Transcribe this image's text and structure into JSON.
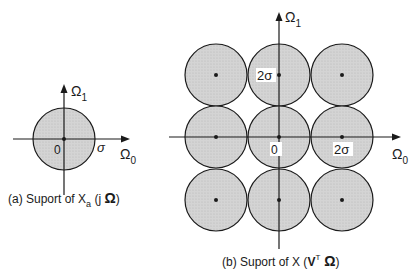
{
  "figure_a": {
    "caption_prefix": "(a)  Suport of X",
    "caption_sub": "a",
    "caption_suffix": " (j ",
    "caption_omega": "Ω",
    "caption_close": ")",
    "axis_x": "Ω",
    "axis_x_sub": "0",
    "axis_y": "Ω",
    "axis_y_sub": "1",
    "origin": "0",
    "radius_label": "σ"
  },
  "figure_b": {
    "caption_prefix": "(b)  Suport of X (",
    "caption_v": "V",
    "caption_sup": "T",
    "caption_omega": " Ω",
    "caption_close": ")",
    "axis_x": "Ω",
    "axis_x_sub": "0",
    "axis_y": "Ω",
    "axis_y_sub": "1",
    "origin": "0",
    "label_x": "2σ",
    "label_y": "2σ"
  },
  "colors": {
    "fill": "#d0d0d0",
    "stroke": "#1a1a1a"
  }
}
